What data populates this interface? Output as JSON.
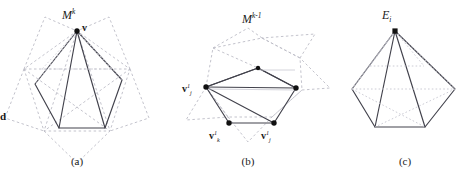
{
  "figure": {
    "width": 470,
    "height": 181,
    "background": "#ffffff",
    "stroke_solid": "#3a3a44",
    "stroke_dashed": "#b9b9c4",
    "stroke_dotted": "#c2c2cc",
    "vertex_fill": "#111111"
  },
  "panels": [
    {
      "id": "a",
      "caption": "(a)",
      "mesh_label": {
        "base": "M",
        "sup": "k"
      },
      "apex_label": "v",
      "side_label": "d"
    },
    {
      "id": "b",
      "caption": "(b)",
      "mesh_label": {
        "base": "M",
        "sup": "k-1"
      },
      "vertices": [
        {
          "base": "v",
          "sub": "j",
          "sup": "1"
        },
        {
          "base": "v",
          "sub": "k",
          "sup": "1"
        },
        {
          "base": "v",
          "sub": "j",
          "sup": "1"
        }
      ]
    },
    {
      "id": "c",
      "caption": "(c)",
      "edge_label": {
        "base": "E",
        "sub": "i"
      }
    }
  ]
}
